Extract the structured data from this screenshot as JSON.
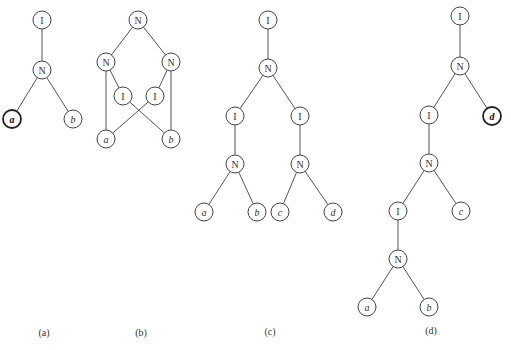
{
  "diagrams": [
    {
      "id": "a",
      "caption": "(a)",
      "caption_pos": [
        44,
        336
      ],
      "nodes": [
        {
          "id": "a1",
          "label": "I",
          "x": 42,
          "y": 20,
          "leaf": false
        },
        {
          "id": "a2",
          "label": "N",
          "x": 42,
          "y": 70,
          "leaf": false
        },
        {
          "id": "a3",
          "label": "a",
          "x": 12,
          "y": 119,
          "leaf": true,
          "bold": true
        },
        {
          "id": "a4",
          "label": "b",
          "x": 73,
          "y": 119,
          "leaf": true
        }
      ],
      "edges": [
        [
          "a1",
          "a2"
        ],
        [
          "a2",
          "a3"
        ],
        [
          "a2",
          "a4"
        ]
      ]
    },
    {
      "id": "b",
      "caption": "(b)",
      "caption_pos": [
        141,
        336
      ],
      "nodes": [
        {
          "id": "b1",
          "label": "N",
          "x": 138,
          "y": 20,
          "leaf": false
        },
        {
          "id": "b2",
          "label": "N",
          "x": 106,
          "y": 62,
          "leaf": false
        },
        {
          "id": "b3",
          "label": "N",
          "x": 171,
          "y": 62,
          "leaf": false
        },
        {
          "id": "b4",
          "label": "I",
          "x": 123,
          "y": 96,
          "leaf": false
        },
        {
          "id": "b5",
          "label": "I",
          "x": 155,
          "y": 96,
          "leaf": false
        },
        {
          "id": "b6",
          "label": "a",
          "x": 106,
          "y": 139,
          "leaf": true
        },
        {
          "id": "b7",
          "label": "b",
          "x": 171,
          "y": 139,
          "leaf": true
        }
      ],
      "edges": [
        [
          "b1",
          "b2"
        ],
        [
          "b1",
          "b3"
        ],
        [
          "b2",
          "b4"
        ],
        [
          "b3",
          "b5"
        ],
        [
          "b2",
          "b6"
        ],
        [
          "b3",
          "b7"
        ],
        [
          "b4",
          "b7"
        ],
        [
          "b5",
          "b6"
        ]
      ]
    },
    {
      "id": "c",
      "caption": "(c)",
      "caption_pos": [
        270,
        335
      ],
      "nodes": [
        {
          "id": "c1",
          "label": "I",
          "x": 268,
          "y": 20,
          "leaf": false
        },
        {
          "id": "c2",
          "label": "N",
          "x": 268,
          "y": 68,
          "leaf": false
        },
        {
          "id": "c3",
          "label": "I",
          "x": 235,
          "y": 116,
          "leaf": false
        },
        {
          "id": "c4",
          "label": "I",
          "x": 300,
          "y": 116,
          "leaf": false
        },
        {
          "id": "c5",
          "label": "N",
          "x": 235,
          "y": 164,
          "leaf": false
        },
        {
          "id": "c6",
          "label": "N",
          "x": 300,
          "y": 164,
          "leaf": false
        },
        {
          "id": "c7",
          "label": "a",
          "x": 204,
          "y": 212,
          "leaf": true
        },
        {
          "id": "c8",
          "label": "b",
          "x": 257,
          "y": 212,
          "leaf": true
        },
        {
          "id": "c9",
          "label": "c",
          "x": 280,
          "y": 212,
          "leaf": true
        },
        {
          "id": "c10",
          "label": "d",
          "x": 333,
          "y": 212,
          "leaf": true
        }
      ],
      "edges": [
        [
          "c1",
          "c2"
        ],
        [
          "c2",
          "c3"
        ],
        [
          "c2",
          "c4"
        ],
        [
          "c3",
          "c5"
        ],
        [
          "c4",
          "c6"
        ],
        [
          "c5",
          "c7"
        ],
        [
          "c5",
          "c8"
        ],
        [
          "c6",
          "c9"
        ],
        [
          "c6",
          "c10"
        ]
      ]
    },
    {
      "id": "d",
      "caption": "(d)",
      "caption_pos": [
        431,
        334
      ],
      "nodes": [
        {
          "id": "d1",
          "label": "I",
          "x": 460,
          "y": 16,
          "leaf": false
        },
        {
          "id": "d2",
          "label": "N",
          "x": 460,
          "y": 66,
          "leaf": false
        },
        {
          "id": "d3",
          "label": "I",
          "x": 429,
          "y": 115,
          "leaf": false
        },
        {
          "id": "d4",
          "label": "d",
          "x": 492,
          "y": 116,
          "leaf": true,
          "bold": true
        },
        {
          "id": "d5",
          "label": "N",
          "x": 429,
          "y": 163,
          "leaf": false
        },
        {
          "id": "d6",
          "label": "I",
          "x": 398,
          "y": 211,
          "leaf": false
        },
        {
          "id": "d7",
          "label": "c",
          "x": 461,
          "y": 211,
          "leaf": true
        },
        {
          "id": "d8",
          "label": "N",
          "x": 398,
          "y": 259,
          "leaf": false
        },
        {
          "id": "d9",
          "label": "a",
          "x": 367,
          "y": 307,
          "leaf": true
        },
        {
          "id": "d10",
          "label": "b",
          "x": 429,
          "y": 307,
          "leaf": true
        }
      ],
      "edges": [
        [
          "d1",
          "d2"
        ],
        [
          "d2",
          "d3"
        ],
        [
          "d2",
          "d4"
        ],
        [
          "d3",
          "d5"
        ],
        [
          "d5",
          "d6"
        ],
        [
          "d5",
          "d7"
        ],
        [
          "d6",
          "d8"
        ],
        [
          "d8",
          "d9"
        ],
        [
          "d8",
          "d10"
        ]
      ]
    }
  ],
  "style": {
    "node_radius": 9,
    "stroke_color": "#444444",
    "background": "#ffffff"
  }
}
